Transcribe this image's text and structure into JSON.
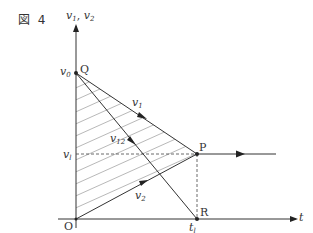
{
  "figure": {
    "label": "図 4",
    "y_axis_label": "v",
    "y_axis_label_sub1": "1",
    "y_axis_label_sep": ",",
    "y_axis_label_sub2": "2",
    "x_axis_label": "t"
  },
  "points": {
    "origin": "O",
    "q": "Q",
    "p": "P",
    "r": "R"
  },
  "labels": {
    "v0_main": "v",
    "v0_sub": "0",
    "vl_main": "v",
    "vl_sub": "l",
    "tl_main": "t",
    "tl_sub": "l",
    "v1_main": "v",
    "v1_sub": "1",
    "v2_main": "v",
    "v2_sub": "2",
    "v12_main": "v",
    "v12_sub": "12"
  },
  "colors": {
    "line": "#333333",
    "hatch": "#9a9a9a",
    "background": "#ffffff"
  },
  "geometry": {
    "origin": [
      76,
      219
    ],
    "Q": [
      76,
      73
    ],
    "P": [
      197,
      154
    ],
    "R": [
      197,
      219
    ]
  }
}
